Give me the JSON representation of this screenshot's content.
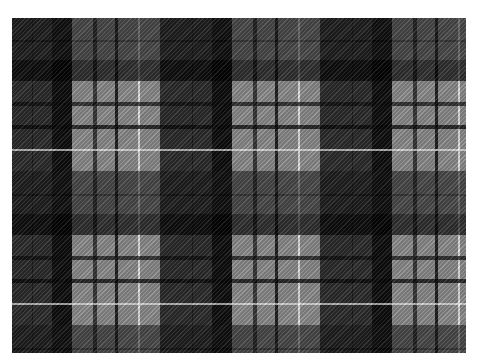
{
  "image": {
    "subject": "Grey and black tartan plaid fabric pattern",
    "description": "Tartan with black/charcoal bands, mid-grey fields, thin black pinstripes and a thin white overcheck stripe, with diagonal twill weave texture",
    "colors": {
      "background": "#ffffff",
      "grey_field": "#8c8c8c",
      "dark_band": "#1e1e1e",
      "dark_on_grey_intersection": "#4a4a4a",
      "black_line": "#222222",
      "white_line": "#e8e8e8"
    },
    "layout": {
      "tartan_left": 12,
      "tartan_top": 18,
      "tartan_width": 454,
      "tartan_height": 335,
      "horizontal_repeat_px": 160,
      "vertical_repeat_px": 154
    }
  }
}
